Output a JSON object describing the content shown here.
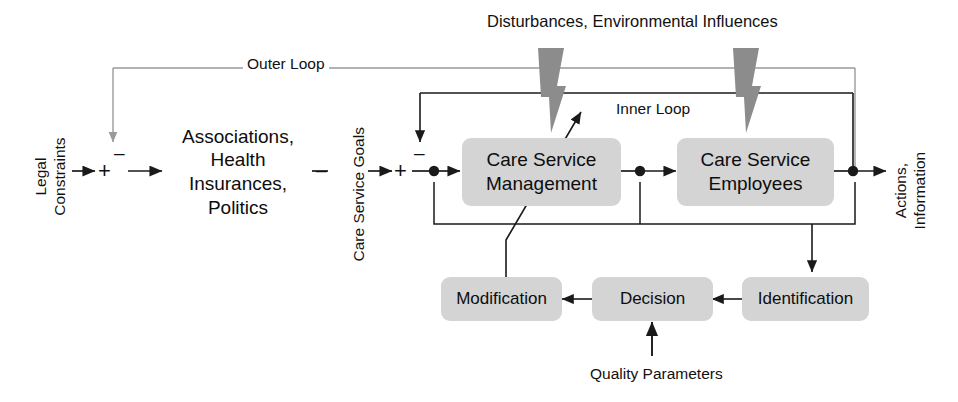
{
  "diagram": {
    "colors": {
      "box_fill": "#d4d4d4",
      "line_black": "#1a1a1a",
      "line_gray": "#9a9a9a",
      "disturbance_gray": "#8c8c8c",
      "text": "#111111"
    },
    "top_label": "Disturbances, Environmental Influences",
    "outer_loop_label": "Outer Loop",
    "inner_loop_label": "Inner Loop",
    "left_input_label": "Legal\nConstraints",
    "mid_input_label": "Care Service Goals",
    "right_output_label": "Actions,\nInformation",
    "quality_label": "Quality Parameters",
    "signs": {
      "junction1_plus": "+",
      "junction1_minus": "–",
      "junction2_plus": "+",
      "junction2_minus": "–",
      "goal_minus": "–"
    },
    "nodes": [
      {
        "id": "associations",
        "label": "Associations, Health\nInsurances, Politics"
      },
      {
        "id": "care-service-management",
        "label": "Care Service\nManagement"
      },
      {
        "id": "care-service-employees",
        "label": "Care Service\nEmployees"
      },
      {
        "id": "modification",
        "label": "Modification"
      },
      {
        "id": "decision",
        "label": "Decision"
      },
      {
        "id": "identification",
        "label": "Identification"
      }
    ]
  }
}
